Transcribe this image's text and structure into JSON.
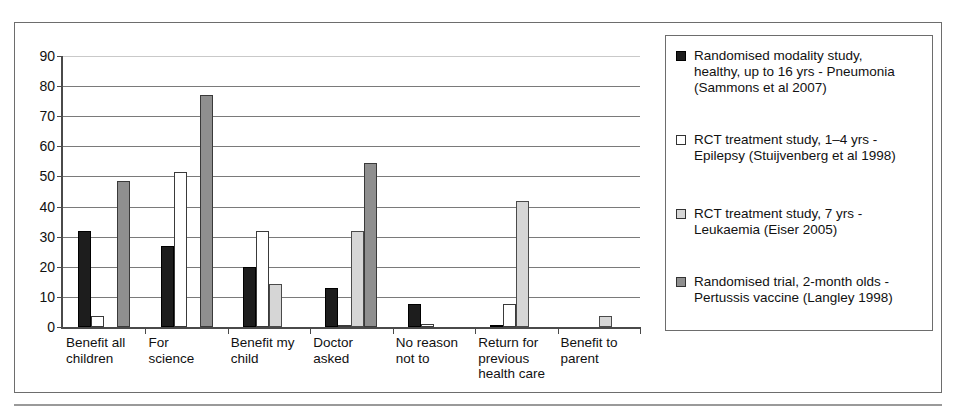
{
  "caption_remnant": "",
  "chart_data": {
    "type": "bar",
    "title": "",
    "xlabel": "",
    "ylabel": "",
    "ylim": [
      0,
      90
    ],
    "yticks": [
      0,
      10,
      20,
      30,
      40,
      50,
      60,
      70,
      80,
      90
    ],
    "grid": true,
    "legend_position": "right",
    "categories": [
      "Benefit all children",
      "For science",
      "Benefit my child",
      "Doctor asked",
      "No reason not to",
      "Return for previous health care",
      "Benefit to parent"
    ],
    "category_lines": [
      [
        "Benefit all",
        "children"
      ],
      [
        "For",
        "science"
      ],
      [
        "Benefit my",
        "child"
      ],
      [
        "Doctor",
        "asked"
      ],
      [
        "No reason",
        "not to"
      ],
      [
        "Return for",
        "previous",
        "health care"
      ],
      [
        "Benefit to",
        "parent"
      ]
    ],
    "series": [
      {
        "name": "Randomised modality study, healthy, up to 16 yrs - Pneumonia (Sammons et al 2007)",
        "name_lines": [
          "Randomised modality study,",
          "healthy, up to 16 yrs - Pneumonia",
          "(Sammons et al 2007)"
        ],
        "color": "#1d1d1d",
        "swatch": "filled-black-square",
        "values": [
          32,
          27,
          20,
          13,
          7.5,
          0.5,
          0
        ]
      },
      {
        "name": "RCT treatment study, 1–4 yrs - Epilepsy (Stuijvenberg et al 1998)",
        "name_lines": [
          "RCT treatment study, 1–4 yrs -",
          "Epilepsy (Stuijvenberg et al 1998)"
        ],
        "color": "#ffffff",
        "swatch": "open-white-square",
        "values": [
          3.5,
          51.5,
          32,
          0.5,
          1,
          7.5,
          0
        ]
      },
      {
        "name": "RCT treatment study, 7 yrs - Leukaemia (Eiser 2005)",
        "name_lines": [
          "RCT treatment study, 7 yrs -",
          "Leukaemia (Eiser 2005)"
        ],
        "color": "#d6d6d6",
        "swatch": "light-grey-square",
        "values": [
          0,
          0,
          14.3,
          32,
          0,
          42,
          3.5
        ]
      },
      {
        "name": "Randomised trial, 2-month olds - Pertussis vaccine (Langley 1998)",
        "name_lines": [
          "Randomised trial, 2-month olds -",
          "Pertussis vaccine (Langley 1998)"
        ],
        "color": "#8f8f8f",
        "swatch": "mid-grey-square",
        "values": [
          48.5,
          77,
          0,
          54.5,
          0,
          0,
          0
        ]
      }
    ]
  }
}
